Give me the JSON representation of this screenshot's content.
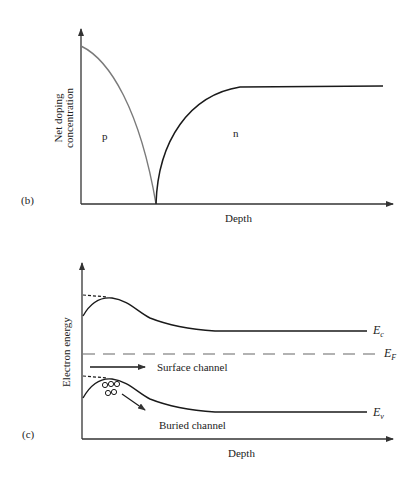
{
  "panel_b": {
    "tag": "(b)",
    "ylabel_line1": "Net doping",
    "ylabel_line2": "concentration",
    "xlabel": "Depth",
    "region_p": "p",
    "region_n": "n",
    "colors": {
      "p_curve": "#7a7a7a",
      "n_curve": "#1a1a1a",
      "axis": "#333333"
    }
  },
  "panel_c": {
    "tag": "(c)",
    "ylabel": "Electron energy",
    "xlabel": "Depth",
    "ec_label": "E",
    "ec_sub": "c",
    "ef_label": "E",
    "ef_sub": "F",
    "ev_label": "E",
    "ev_sub": "v",
    "surface_channel": "Surface channel",
    "buried_channel": "Buried channel",
    "colors": {
      "curve": "#1a1a1a",
      "fermi": "#666666",
      "axis": "#333333"
    }
  }
}
